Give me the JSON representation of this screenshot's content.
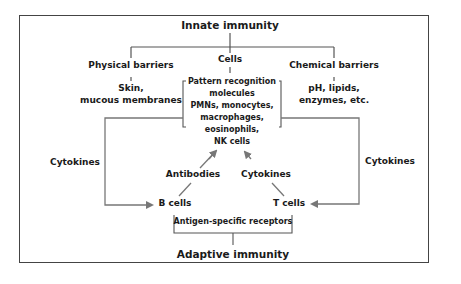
{
  "diagram": {
    "title_top": "Innate immunity",
    "title_bottom": "Adaptive immunity",
    "nodes": {
      "physical_barriers": "Physical barriers",
      "physical_examples_1": "Skin,",
      "physical_examples_2": "mucous membranes",
      "cells": "Cells",
      "cells_list": [
        "Pattern recognition",
        "molecules",
        "PMNs, monocytes,",
        "macrophages,",
        "eosinophils,",
        "NK cells"
      ],
      "chemical_barriers": "Chemical barriers",
      "chemical_examples_1": "pH, lipids,",
      "chemical_examples_2": "enzymes, etc.",
      "b_cells": "B cells",
      "t_cells": "T cells",
      "antigen_receptors": "Antigen-specific receptors"
    },
    "edges": {
      "left_cytokines": "Cytokines",
      "right_cytokines": "Cytokines",
      "antibodies": "Antibodies",
      "center_cytokines": "Cytokines"
    },
    "colors": {
      "line": "#555555",
      "arrow": "#777777",
      "text": "#1a1a1a",
      "border": "#444444"
    }
  }
}
